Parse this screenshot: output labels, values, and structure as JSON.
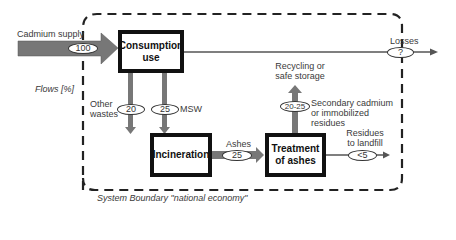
{
  "diagram": {
    "legend": {
      "flows_unit": "Flows [%]",
      "system_boundary": "System Boundary \"national economy\""
    },
    "inputs": {
      "cadmium_supply": {
        "label": "Cadmium supply",
        "value": "100"
      }
    },
    "processes": [
      {
        "id": "consumption",
        "label": "Consumption use"
      },
      {
        "id": "incineration",
        "label": "Incineration"
      },
      {
        "id": "treatment",
        "label": "Treatment of ashes"
      }
    ],
    "flows": {
      "losses": {
        "label": "Losses",
        "value": "?"
      },
      "other_wastes": {
        "label": "Other wastes",
        "value": "20"
      },
      "msw": {
        "label": "MSW",
        "value": "25"
      },
      "ashes": {
        "label": "Ashes",
        "value": "25"
      },
      "recycling": {
        "label": "Recycling or safe storage",
        "value": "20-25",
        "note": "Secondary cadmium or immobilized residues"
      },
      "landfill": {
        "label": "Residues to landfill",
        "value": "<5"
      }
    },
    "colors": {
      "arrow_fill": "#7a7a7a",
      "box_border": "#111111",
      "line": "#555555"
    }
  }
}
